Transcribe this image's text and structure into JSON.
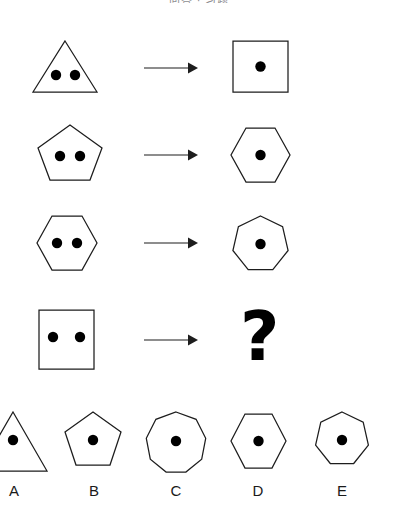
{
  "header": {
    "title_truncated": "问答  ·  习题"
  },
  "puzzle": {
    "type": "visual-sequence-analogy",
    "rule_description": "n-sided polygon containing 2 dots transforms into an (n+1)-sided polygon containing 1 dot",
    "rows": [
      {
        "index": 1,
        "left": {
          "shape": "triangle",
          "sides": 3,
          "dots": 2
        },
        "operator": "arrow-right",
        "right": {
          "shape": "square",
          "sides": 4,
          "dots": 1
        }
      },
      {
        "index": 2,
        "left": {
          "shape": "pentagon",
          "sides": 5,
          "dots": 2
        },
        "operator": "arrow-right",
        "right": {
          "shape": "hexagon",
          "sides": 6,
          "dots": 1
        }
      },
      {
        "index": 3,
        "left": {
          "shape": "hexagon",
          "sides": 6,
          "dots": 2
        },
        "operator": "arrow-right",
        "right": {
          "shape": "heptagon",
          "sides": 7,
          "dots": 1
        }
      },
      {
        "index": 4,
        "left": {
          "shape": "square",
          "sides": 4,
          "dots": 2
        },
        "operator": "arrow-right",
        "right": {
          "shape": "unknown",
          "sides": 0,
          "dots": 0,
          "placeholder": "?"
        }
      }
    ],
    "question_placeholder": "?",
    "options": [
      {
        "label": "A",
        "shape": "triangle",
        "sides": 3,
        "dots": 1,
        "clipped_left": true
      },
      {
        "label": "B",
        "shape": "pentagon",
        "sides": 5,
        "dots": 1,
        "clipped_left": false
      },
      {
        "label": "C",
        "shape": "nonagon",
        "sides": 9,
        "dots": 1,
        "clipped_left": false
      },
      {
        "label": "D",
        "shape": "hexagon",
        "sides": 6,
        "dots": 1,
        "clipped_left": false
      },
      {
        "label": "E",
        "shape": "heptagon",
        "sides": 7,
        "dots": 1,
        "clipped_left": false
      }
    ]
  },
  "colors": {
    "stroke": "#1d1d1d",
    "dot": "#000000",
    "background": "#ffffff",
    "header_text": "#8d8d90",
    "label_text": "#1a1a1a"
  }
}
